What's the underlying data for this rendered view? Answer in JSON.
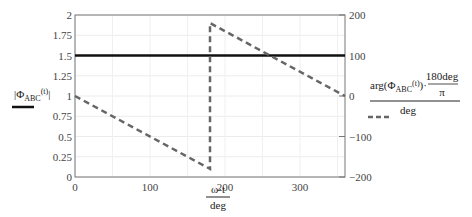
{
  "chart_data": {
    "type": "line",
    "title": "",
    "xlabel": {
      "numerator": "ω·t",
      "denominator": "deg"
    },
    "ylabel_left": {
      "text": "|Φ",
      "subscript": "ABC",
      "suffix": "(t)|"
    },
    "ylabel_right": {
      "numerator": "arg(Φ",
      "subscript": "ABC",
      "suffix": "(t))·",
      "frac_num": "180deg",
      "frac_den": "π",
      "denominator": "deg"
    },
    "xlim": [
      0,
      360
    ],
    "ylim_left": [
      0,
      2
    ],
    "ylim_right": [
      -200,
      200
    ],
    "x_ticks": [
      "0",
      "100",
      "200",
      "300"
    ],
    "y_ticks_left": [
      "0",
      "0.25",
      "0.5",
      "0.75",
      "1",
      "1.25",
      "1.5",
      "1.75",
      "2"
    ],
    "y_ticks_right": [
      "-200",
      "-100",
      "0",
      "100",
      "200"
    ],
    "grid": true,
    "series": [
      {
        "name": "|ΦABC(t)|",
        "axis": "left",
        "style": "solid",
        "color": "#111111",
        "x": [
          0,
          360
        ],
        "y": [
          1.5,
          1.5
        ]
      },
      {
        "name": "arg(ΦABC(t))·180deg/π / deg",
        "axis": "right",
        "style": "dashed",
        "color": "#666666",
        "x": [
          0,
          180,
          180,
          360
        ],
        "y": [
          0,
          -180,
          180,
          0
        ]
      }
    ]
  }
}
